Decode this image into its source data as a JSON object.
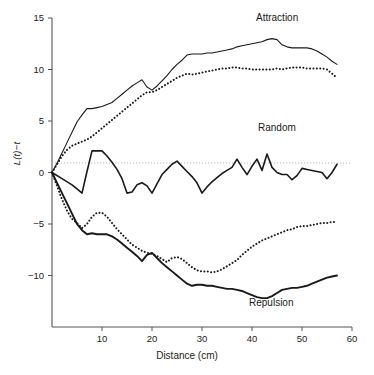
{
  "chart_data": {
    "type": "line",
    "title": "",
    "xlabel": "Distance (cm)",
    "ylabel": "L(t)−t",
    "xlim": [
      0,
      60
    ],
    "ylim": [
      -15,
      15
    ],
    "xticks": [
      10,
      20,
      30,
      40,
      50,
      60
    ],
    "yticks": [
      15,
      10,
      5,
      0,
      -5,
      -10
    ],
    "grid": false,
    "reference_line": {
      "y": 0,
      "style": "dotted",
      "color": "#aaaaaa"
    },
    "legend_position": "inline-annotations",
    "annotations": [
      {
        "text": "Attraction",
        "x": 46,
        "y": 14
      },
      {
        "text": "Random",
        "x": 46,
        "y": 3.2
      },
      {
        "text": "Repulsion",
        "x": 44,
        "y": -13.2
      }
    ],
    "series": [
      {
        "name": "Attraction upper envelope",
        "style": "solid",
        "color": "#1a1a1a",
        "width": 1.1,
        "x": [
          0,
          1,
          2,
          3,
          4,
          5,
          6,
          7,
          8,
          9,
          10,
          11,
          12,
          13,
          14,
          15,
          16,
          17,
          18,
          19,
          20,
          21,
          22,
          23,
          24,
          25,
          26,
          27,
          28,
          29,
          30,
          31,
          32,
          33,
          34,
          35,
          36,
          37,
          38,
          39,
          40,
          41,
          42,
          43,
          44,
          45,
          46,
          47,
          48,
          49,
          50,
          51,
          52,
          53,
          54,
          55,
          56,
          57
        ],
        "y": [
          0.0,
          0.9,
          1.9,
          2.9,
          3.9,
          4.9,
          5.6,
          6.2,
          6.2,
          6.3,
          6.4,
          6.6,
          6.8,
          7.2,
          7.6,
          8.0,
          8.4,
          8.7,
          9.0,
          8.3,
          8.0,
          8.4,
          8.9,
          9.4,
          10.0,
          10.5,
          10.9,
          11.4,
          11.5,
          11.5,
          11.5,
          11.6,
          11.6,
          11.7,
          11.8,
          11.9,
          12.0,
          12.2,
          12.3,
          12.4,
          12.5,
          12.6,
          12.7,
          12.9,
          13.0,
          12.9,
          12.4,
          12.2,
          12.1,
          12.1,
          12.1,
          12.1,
          12.0,
          11.8,
          11.5,
          11.2,
          10.8,
          10.5
        ]
      },
      {
        "name": "Attraction observed",
        "style": "dotted",
        "color": "#1a1a1a",
        "width": 2.0,
        "x": [
          0,
          1,
          2,
          3,
          4,
          5,
          6,
          7,
          8,
          9,
          10,
          11,
          12,
          13,
          14,
          15,
          16,
          17,
          18,
          19,
          20,
          21,
          22,
          23,
          24,
          25,
          26,
          27,
          28,
          29,
          30,
          31,
          32,
          33,
          34,
          35,
          36,
          37,
          38,
          39,
          40,
          41,
          42,
          43,
          44,
          45,
          46,
          47,
          48,
          49,
          50,
          51,
          52,
          53,
          54,
          55,
          56,
          57
        ],
        "y": [
          0.0,
          0.8,
          1.6,
          2.2,
          2.6,
          2.8,
          3.0,
          3.2,
          3.5,
          3.9,
          4.3,
          4.7,
          5.1,
          5.5,
          5.9,
          6.3,
          6.7,
          7.1,
          7.5,
          7.8,
          7.8,
          8.0,
          8.3,
          8.6,
          8.9,
          9.2,
          9.4,
          9.6,
          9.5,
          9.6,
          9.7,
          9.8,
          9.9,
          10.0,
          10.1,
          10.1,
          10.2,
          10.2,
          10.1,
          10.1,
          10.0,
          10.0,
          10.0,
          10.0,
          10.0,
          10.1,
          10.0,
          10.1,
          10.2,
          10.2,
          10.2,
          10.1,
          10.1,
          10.1,
          10.1,
          10.0,
          9.6,
          9.2
        ]
      },
      {
        "name": "Random",
        "style": "solid",
        "color": "#1a1a1a",
        "width": 1.6,
        "x": [
          0,
          2,
          4,
          5,
          6,
          7,
          8,
          9,
          10,
          11,
          12,
          13,
          14,
          15,
          16,
          17,
          18,
          19,
          20,
          21,
          22,
          23,
          24,
          25,
          26,
          27,
          28,
          29,
          30,
          31,
          32,
          33,
          34,
          35,
          36,
          37,
          38,
          39,
          40,
          41,
          42,
          43,
          44,
          45,
          46,
          47,
          48,
          49,
          50,
          51,
          52,
          53,
          54,
          55,
          56,
          57
        ],
        "y": [
          0.0,
          -0.6,
          -1.2,
          -1.6,
          -2.0,
          0.1,
          2.1,
          2.1,
          2.1,
          1.6,
          1.0,
          0.3,
          -0.6,
          -2.0,
          -1.9,
          -1.2,
          -1.0,
          -1.3,
          -2.0,
          -1.1,
          -0.2,
          0.3,
          0.8,
          1.1,
          0.6,
          0.1,
          -0.4,
          -1.0,
          -2.0,
          -1.4,
          -0.9,
          -0.5,
          -0.1,
          0.2,
          0.5,
          1.3,
          0.5,
          -0.2,
          0.6,
          1.3,
          0.2,
          1.8,
          0.5,
          0.0,
          -0.2,
          -0.2,
          -0.7,
          -0.3,
          0.4,
          0.3,
          0.2,
          0.1,
          0.0,
          -0.6,
          0.0,
          0.8
        ]
      },
      {
        "name": "Repulsion lower envelope",
        "style": "solid",
        "color": "#1a1a1a",
        "width": 1.9,
        "x": [
          0,
          1,
          2,
          3,
          4,
          5,
          6,
          7,
          8,
          9,
          10,
          11,
          12,
          13,
          14,
          15,
          16,
          17,
          18,
          19,
          20,
          21,
          22,
          23,
          24,
          25,
          26,
          27,
          28,
          29,
          30,
          31,
          32,
          33,
          34,
          35,
          36,
          37,
          38,
          39,
          40,
          41,
          42,
          43,
          44,
          45,
          46,
          47,
          48,
          49,
          50,
          51,
          52,
          53,
          54,
          55,
          56,
          57
        ],
        "y": [
          0.0,
          -1.0,
          -2.0,
          -3.0,
          -4.0,
          -5.0,
          -5.6,
          -6.0,
          -5.9,
          -6.0,
          -6.0,
          -6.0,
          -6.2,
          -6.5,
          -6.9,
          -7.3,
          -7.7,
          -8.1,
          -8.6,
          -8.0,
          -7.8,
          -8.3,
          -8.8,
          -9.2,
          -9.6,
          -10.0,
          -10.4,
          -10.8,
          -11.0,
          -10.9,
          -10.9,
          -11.0,
          -11.0,
          -11.1,
          -11.2,
          -11.3,
          -11.3,
          -11.4,
          -11.5,
          -11.7,
          -11.9,
          -12.1,
          -12.2,
          -12.2,
          -12.0,
          -11.7,
          -11.4,
          -11.3,
          -11.2,
          -11.2,
          -11.1,
          -11.0,
          -10.8,
          -10.6,
          -10.4,
          -10.2,
          -10.1,
          -10.0
        ]
      },
      {
        "name": "Repulsion observed",
        "style": "dotted",
        "color": "#1a1a1a",
        "width": 2.0,
        "x": [
          0,
          1,
          2,
          3,
          4,
          5,
          6,
          7,
          8,
          9,
          10,
          11,
          12,
          13,
          14,
          15,
          16,
          17,
          18,
          19,
          20,
          21,
          22,
          23,
          24,
          25,
          26,
          27,
          28,
          29,
          30,
          31,
          32,
          33,
          34,
          35,
          36,
          37,
          38,
          39,
          40,
          41,
          42,
          43,
          44,
          45,
          46,
          47,
          48,
          49,
          50,
          51,
          52,
          53,
          54,
          55,
          56,
          57
        ],
        "y": [
          0.0,
          -1.3,
          -2.6,
          -3.7,
          -4.5,
          -4.9,
          -5.4,
          -5.0,
          -4.3,
          -3.9,
          -3.9,
          -4.3,
          -4.9,
          -5.5,
          -6.0,
          -6.5,
          -7.0,
          -7.3,
          -7.6,
          -7.8,
          -7.9,
          -8.1,
          -8.4,
          -8.7,
          -8.3,
          -8.2,
          -8.4,
          -8.8,
          -9.2,
          -9.5,
          -9.6,
          -9.6,
          -9.7,
          -9.6,
          -9.4,
          -9.1,
          -8.8,
          -8.5,
          -8.0,
          -7.6,
          -7.2,
          -6.9,
          -6.6,
          -6.4,
          -6.2,
          -6.0,
          -5.8,
          -5.6,
          -5.5,
          -5.3,
          -5.2,
          -5.2,
          -5.1,
          -5.0,
          -4.9,
          -4.9,
          -4.8,
          -4.8
        ]
      }
    ]
  },
  "axes": {
    "x_tick_labels": [
      "10",
      "20",
      "30",
      "40",
      "50",
      "60"
    ],
    "y_tick_labels": [
      "15",
      "10",
      "5",
      "0",
      "−5",
      "−10"
    ],
    "x_title": "Distance (cm)",
    "y_title": "L(t)−t"
  },
  "annotations": {
    "attraction": "Attraction",
    "random": "Random",
    "repulsion": "Repulsion"
  }
}
